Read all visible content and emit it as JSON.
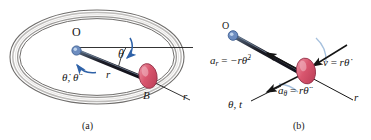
{
  "figure": {
    "kind": "kinematics-diagram",
    "width": 371,
    "height": 140,
    "background": "#ffffff"
  },
  "colors": {
    "ring_body": "#a5a3a1",
    "ring_outline": "#6f6d6b",
    "ring_highlight": "#e9e7e5",
    "collar_fill": "#d9566e",
    "collar_shade": "#b83b55",
    "collar_highlight": "#ef9fae",
    "arm_dark": "#1b1b24",
    "arm_blue": "#5f7fa8",
    "motion_arrow_blue": "#2f62a8",
    "vector_black": "#141414",
    "label_text": "#161616",
    "pin_blue": "#6d8dc0"
  },
  "panel_a": {
    "caption": "(a)",
    "labels": {
      "origin": "O",
      "theta": "θ",
      "radius_arm": "r",
      "radial_axis": "r",
      "collar": "B",
      "angular_rates": "θ̇, θ̈"
    },
    "elements": {
      "ring_name": "circular-guide-ring",
      "arm_name": "rotating-arm-OB",
      "collar_name": "collar-B",
      "pin_name": "pin-support-O",
      "horizontal_ref_name": "horizontal-reference-line",
      "radial_axis_name": "radial-axis-r",
      "angle_arc_name": "theta-angle-arc",
      "rotation_arrow_name": "angular-motion-arrow"
    }
  },
  "panel_b": {
    "caption": "(b)",
    "labels": {
      "origin": "O",
      "radial_accel_lhs": "a",
      "radial_accel_sub": "r",
      "radial_accel_rhs": "−rθ̇",
      "radial_accel_exp": "2",
      "transverse_accel_lhs": "a",
      "transverse_accel_sub": "θ",
      "transverse_accel_rhs": "rθ̈",
      "velocity_lhs": "v",
      "velocity_rhs": "rθ̇",
      "radial_axis": "r",
      "transverse_axis": "θ, t",
      "equals": "="
    },
    "elements": {
      "arm_name": "rotating-arm-OB",
      "collar_name": "collar-B",
      "pin_name": "pin-support-O",
      "radial_accel_vector_name": "radial-acceleration-vector",
      "transverse_accel_vector_name": "transverse-acceleration-vector",
      "velocity_vector_name": "velocity-vector",
      "radial_axis_name": "radial-axis-r",
      "transverse_axis_name": "transverse-axis-theta",
      "curve_hint_name": "path-tangent-curve"
    }
  }
}
